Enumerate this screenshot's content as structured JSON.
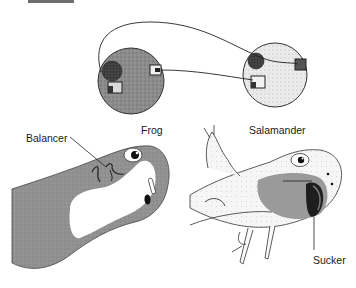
{
  "figure": {
    "type": "diagram",
    "labels": {
      "frog": "Frog",
      "salamander": "Salamander",
      "balancer": "Balancer",
      "sucker": "Sucker"
    },
    "colors": {
      "frog_tissue": "#8f8f8f",
      "frog_embryo": "#8a8a8a",
      "salamander_embryo": "#e6e6e6",
      "salamander_body": "#f3f3f3",
      "mouth_shading": "#939393",
      "outline": "#2a2a2a",
      "dark_patch": "#2e2e2e",
      "background": "#ffffff"
    },
    "embryos": [
      {
        "name": "frog-embryo",
        "description": "Dark stippled sphere with neural patch and two transplant squares"
      },
      {
        "name": "salamander-embryo",
        "description": "Light stippled sphere with neural patch and two transplant squares"
      }
    ],
    "connections": [
      {
        "from": "frog-embryo-left-square",
        "to": "salamander-embryo-right-square"
      },
      {
        "from": "frog-embryo-right-square",
        "to": "salamander-embryo-left-square"
      }
    ]
  }
}
